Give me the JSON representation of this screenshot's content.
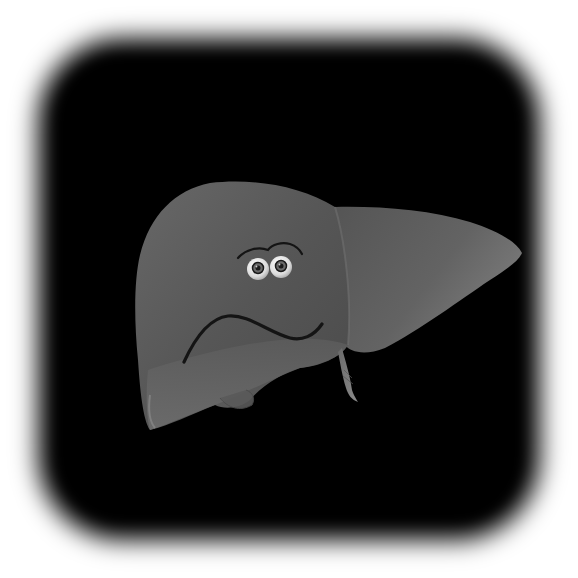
{
  "image": {
    "subject": "cartoon liver with worried face",
    "alt": "Grayscale cartoon illustration of a human liver with two eyes, eyebrows and a frowning mouth on a black rounded background",
    "background_color": "#ffffff",
    "backdrop_color": "#000000"
  },
  "liver": {
    "right_lobe_color": "#5a5a5a",
    "left_lobe_color": "#5e5e5e",
    "highlight_color": "#7a7a7a",
    "shadow_color": "#3e3e3e"
  },
  "face": {
    "expression": "worried",
    "eye_white": "#e8e8e8",
    "pupil": "#1a1a1a",
    "iris": "#6a6a6a",
    "line_color": "#141414"
  }
}
